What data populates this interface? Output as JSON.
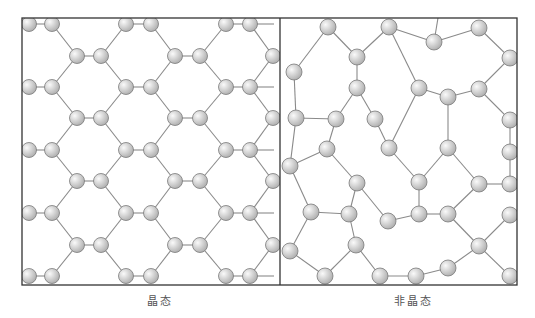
{
  "figure": {
    "panels": [
      {
        "id": "crystalline",
        "caption": "晶态",
        "caption_x": 160,
        "box": {
          "x": 22,
          "y": 18,
          "w": 258,
          "h": 267
        }
      },
      {
        "id": "amorphous",
        "caption": "非晶态",
        "caption_x": 413,
        "box": {
          "x": 280,
          "y": 18,
          "w": 237,
          "h": 267
        }
      }
    ],
    "colors": {
      "frame": "#333333",
      "bond": "#8a8a8a",
      "atom_fill_light": "#fafafa",
      "atom_fill_dark": "#a8a8a8",
      "atom_stroke": "#7a7a7a"
    },
    "crystal": {
      "atom_radius": 7.5,
      "row_ys": [
        24,
        56,
        87,
        118,
        150,
        181,
        213,
        245,
        276
      ],
      "even_row_xs": [
        29,
        52,
        126,
        151,
        226,
        250
      ],
      "odd_row_xs": [
        77,
        101,
        175,
        200,
        273
      ]
    },
    "amorphous": {
      "atoms": [
        [
          328,
          27,
          8
        ],
        [
          389,
          27,
          8
        ],
        [
          434,
          42,
          8
        ],
        [
          479,
          28,
          8
        ],
        [
          294,
          72,
          8
        ],
        [
          357,
          57,
          8
        ],
        [
          510,
          58,
          8
        ],
        [
          357,
          88,
          8
        ],
        [
          419,
          88,
          8
        ],
        [
          448,
          97,
          8
        ],
        [
          479,
          89,
          8
        ],
        [
          296,
          118,
          8
        ],
        [
          336,
          119,
          8
        ],
        [
          375,
          119,
          8
        ],
        [
          510,
          120,
          8
        ],
        [
          327,
          149,
          8
        ],
        [
          389,
          148,
          8
        ],
        [
          448,
          148,
          8
        ],
        [
          510,
          152,
          8
        ],
        [
          290,
          166,
          8
        ],
        [
          357,
          183,
          8
        ],
        [
          419,
          182,
          8
        ],
        [
          479,
          184,
          8
        ],
        [
          510,
          184,
          8
        ],
        [
          311,
          212,
          8
        ],
        [
          349,
          214,
          8
        ],
        [
          388,
          221,
          8
        ],
        [
          419,
          214,
          8
        ],
        [
          448,
          214,
          8
        ],
        [
          510,
          215,
          8
        ],
        [
          290,
          251,
          8
        ],
        [
          356,
          245,
          8
        ],
        [
          479,
          246,
          8
        ],
        [
          325,
          276,
          8
        ],
        [
          380,
          276,
          8
        ],
        [
          416,
          276,
          8
        ],
        [
          448,
          268,
          8
        ],
        [
          510,
          276,
          8
        ]
      ],
      "bonds": [
        [
          0,
          4
        ],
        [
          0,
          5
        ],
        [
          1,
          5
        ],
        [
          1,
          8
        ],
        [
          1,
          2
        ],
        [
          2,
          3
        ],
        [
          3,
          6
        ],
        [
          6,
          10
        ],
        [
          5,
          7
        ],
        [
          7,
          13
        ],
        [
          7,
          12
        ],
        [
          12,
          11
        ],
        [
          11,
          4
        ],
        [
          8,
          9
        ],
        [
          9,
          10
        ],
        [
          9,
          17
        ],
        [
          10,
          14
        ],
        [
          14,
          18
        ],
        [
          12,
          15
        ],
        [
          15,
          20
        ],
        [
          13,
          16
        ],
        [
          8,
          16
        ],
        [
          16,
          21
        ],
        [
          17,
          22
        ],
        [
          17,
          21
        ],
        [
          18,
          23
        ],
        [
          22,
          23
        ],
        [
          22,
          28
        ],
        [
          19,
          24
        ],
        [
          20,
          25
        ],
        [
          20,
          26
        ],
        [
          24,
          25
        ],
        [
          25,
          31
        ],
        [
          26,
          27
        ],
        [
          27,
          28
        ],
        [
          21,
          27
        ],
        [
          24,
          30
        ],
        [
          30,
          33
        ],
        [
          31,
          33
        ],
        [
          31,
          34
        ],
        [
          34,
          35
        ],
        [
          35,
          36
        ],
        [
          36,
          32
        ],
        [
          32,
          29
        ],
        [
          32,
          37
        ],
        [
          28,
          32
        ],
        [
          19,
          15
        ],
        [
          11,
          19
        ]
      ]
    }
  }
}
